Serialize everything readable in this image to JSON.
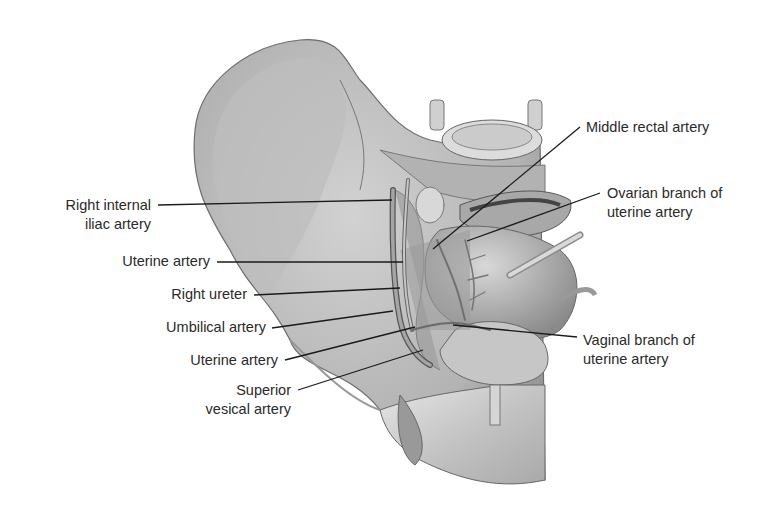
{
  "figure": {
    "labels_left": [
      {
        "id": "right-internal-iliac-artery",
        "lines": [
          "Right internal",
          "iliac artery"
        ]
      },
      {
        "id": "uterine-artery-upper",
        "lines": [
          "Uterine artery"
        ]
      },
      {
        "id": "right-ureter",
        "lines": [
          "Right ureter"
        ]
      },
      {
        "id": "umbilical-artery",
        "lines": [
          "Umbilical artery"
        ]
      },
      {
        "id": "uterine-artery-lower",
        "lines": [
          "Uterine artery"
        ]
      },
      {
        "id": "superior-vesical-artery",
        "lines": [
          "Superior",
          "vesical artery"
        ]
      }
    ],
    "labels_right": [
      {
        "id": "middle-rectal-artery",
        "lines": [
          "Middle rectal artery"
        ]
      },
      {
        "id": "ovarian-branch",
        "lines": [
          "Ovarian branch of",
          "uterine artery"
        ]
      },
      {
        "id": "vaginal-branch",
        "lines": [
          "Vaginal branch of",
          "uterine artery"
        ]
      }
    ],
    "colors": {
      "text": "#2a2a2a",
      "leader": "#1a1a1a",
      "bone": "#c9c9c9",
      "shadow": "#8a8a8a"
    }
  }
}
